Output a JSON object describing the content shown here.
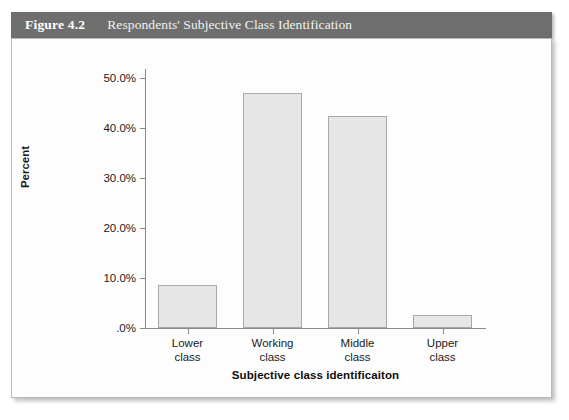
{
  "figure": {
    "number": "Figure 4.2",
    "caption": "Respondents' Subjective Class Identification"
  },
  "chart_data": {
    "type": "bar",
    "title": "Respondents' Subjective Class Identification",
    "categories": [
      "Lower class",
      "Working class",
      "Middle class",
      "Upper class"
    ],
    "category_lines": [
      [
        "Lower",
        "class"
      ],
      [
        "Working",
        "class"
      ],
      [
        "Middle",
        "class"
      ],
      [
        "Upper",
        "class"
      ]
    ],
    "values": [
      8.7,
      47.0,
      42.5,
      2.7
    ],
    "value_labels": [
      "8.7%",
      "47.0%",
      "42.5%",
      "2.7%"
    ],
    "xlabel": "Subjective class identificaiton",
    "ylabel": "Percent",
    "ylim": [
      0,
      52
    ],
    "yticks": [
      0,
      10,
      20,
      30,
      40,
      50
    ],
    "ytick_labels": [
      ".0%",
      "10.0%",
      "20.0%",
      "30.0%",
      "40.0%",
      "50.0%"
    ],
    "grid": false,
    "legend": "none",
    "bar_color": "#e6e6e6",
    "bar_border_color": "#a8a8a8",
    "header_color": "#6e6e6e",
    "panel_color": "#fdfdfd",
    "axis_color": "#8a8a8a",
    "text_color": "#1b1b1b"
  }
}
